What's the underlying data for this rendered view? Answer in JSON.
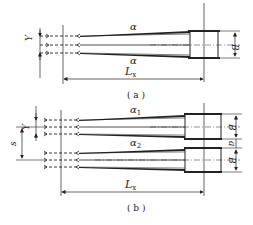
{
  "figure_a": {
    "angle_label_top": "α",
    "angle_label_bottom": "α",
    "width_label": "B",
    "spacing_label": "Y",
    "length_label": "L",
    "length_subscript": "x",
    "caption": "( a )"
  },
  "figure_b": {
    "angle_label_1": "α",
    "angle_sub_1": "1",
    "angle_label_2": "α",
    "angle_sub_2": "2",
    "width_label_1": "B",
    "width_label_2": "B",
    "gap_label": "a",
    "spacing_label": "Y",
    "offset_label": "s",
    "length_label": "L",
    "length_subscript": "x",
    "caption": "( b )"
  },
  "colors": {
    "line": "#222222",
    "background": "#ffffff"
  }
}
